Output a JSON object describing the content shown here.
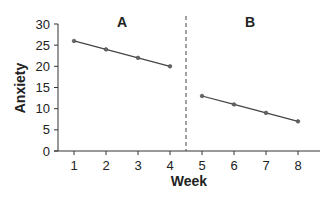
{
  "chart_data": {
    "type": "line",
    "title": "",
    "xlabel": "Week",
    "ylabel": "Anxiety",
    "ylim": [
      0,
      30
    ],
    "xlim": [
      0.5,
      8.5
    ],
    "y_ticks": [
      0,
      5,
      10,
      15,
      20,
      25,
      30
    ],
    "x_ticks": [
      1,
      2,
      3,
      4,
      5,
      6,
      7,
      8
    ],
    "grid": false,
    "phase_divider_x": 4.5,
    "series": [
      {
        "name": "A",
        "x": [
          1,
          2,
          3,
          4
        ],
        "values": [
          26,
          24,
          22,
          20
        ]
      },
      {
        "name": "B",
        "x": [
          5,
          6,
          7,
          8
        ],
        "values": [
          13,
          11,
          9,
          7
        ]
      }
    ],
    "annotations": [
      {
        "text": "A",
        "x": 2.5,
        "y": 29
      },
      {
        "text": "B",
        "x": 6.5,
        "y": 29
      }
    ]
  }
}
